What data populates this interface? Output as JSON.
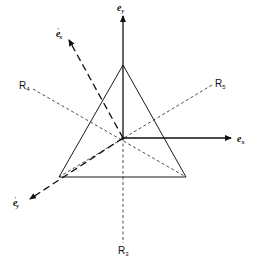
{
  "diagram": {
    "type": "triangle-symmetry-axes",
    "center": [
      123,
      138
    ],
    "triangle": {
      "vertices": [
        [
          123,
          65
        ],
        [
          59,
          177
        ],
        [
          186,
          177
        ]
      ],
      "stroke": "#1a1a1a"
    },
    "axes": [
      {
        "id": "e_y",
        "label": "e",
        "subscript": "y",
        "prime": false,
        "from": [
          123,
          138
        ],
        "to": [
          123,
          14
        ],
        "style": "solid"
      },
      {
        "id": "e_x",
        "label": "e",
        "subscript": "x",
        "prime": false,
        "from": [
          123,
          138
        ],
        "to": [
          233,
          138
        ],
        "style": "solid"
      },
      {
        "id": "e_x_prime",
        "label": "e",
        "subscript": "x",
        "prime": true,
        "from": [
          123,
          138
        ],
        "to": [
          68,
          38
        ],
        "style": "dashed"
      },
      {
        "id": "e_y_prime",
        "label": "e",
        "subscript": "y",
        "prime": true,
        "from": [
          123,
          138
        ],
        "to": [
          28,
          200
        ],
        "style": "dashed"
      }
    ],
    "reflection_lines": [
      {
        "id": "R3",
        "label": "R",
        "subscript": "3",
        "from": [
          123,
          138
        ],
        "to": [
          123,
          243
        ]
      },
      {
        "id": "R4",
        "label": "R",
        "subscript": "4",
        "from": [
          33,
          89
        ],
        "to": [
          186,
          177
        ]
      },
      {
        "id": "R5",
        "label": "R",
        "subscript": "5",
        "from": [
          212,
          85
        ],
        "to": [
          59,
          177
        ]
      }
    ]
  },
  "labels": {
    "ey": {
      "base": "e",
      "sub": "y"
    },
    "ex": {
      "base": "e",
      "sub": "x"
    },
    "exp": {
      "base": "e",
      "sub": "x",
      "sup": "′"
    },
    "eyp": {
      "base": "e",
      "sub": "y",
      "sup": "′"
    },
    "r3": {
      "base": "R",
      "sub": "3"
    },
    "r4": {
      "base": "R",
      "sub": "4"
    },
    "r5": {
      "base": "R",
      "sub": "5"
    }
  }
}
